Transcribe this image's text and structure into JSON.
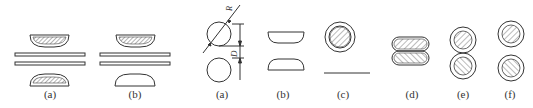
{
  "figure_left": {
    "panels": [
      {
        "id": "a",
        "label": "(a)",
        "cx": 50,
        "bottom_shoe_hatched": true
      },
      {
        "id": "b",
        "label": "(b)",
        "cx": 135,
        "bottom_shoe_hatched": false
      }
    ]
  },
  "figure_right": {
    "panels": [
      {
        "id": "a",
        "label": "(a)",
        "cx": 220,
        "dimension_labels": {
          "diagonal": "R",
          "vertical": "D"
        }
      },
      {
        "id": "b",
        "label": "(b)",
        "cx": 290
      },
      {
        "id": "c",
        "label": "(c)",
        "cx": 335
      },
      {
        "id": "d",
        "label": "(d)",
        "cx": 405
      },
      {
        "id": "e",
        "label": "(e)",
        "cx": 462
      },
      {
        "id": "f",
        "label": "(f)",
        "cx": 510
      }
    ]
  },
  "colors": {
    "stroke": "#333333",
    "hatch": "#555555",
    "background": "#ffffff"
  }
}
